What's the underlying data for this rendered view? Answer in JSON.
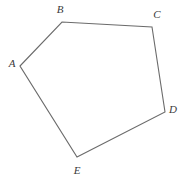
{
  "figure": {
    "kind": "geometry-diagram",
    "shape_name": "pentagon",
    "background_color": "#ffffff",
    "stroke_color": "#6b6b6b",
    "stroke_width": 1.1,
    "label_color": "#3a3a3a",
    "canvas": {
      "width": 184,
      "height": 179
    }
  },
  "chart_data": {
    "type": "scatter",
    "title": "",
    "subtitle": "",
    "xlabel": "",
    "ylabel": "",
    "grid": false,
    "legend": "none",
    "xlim": [
      0,
      184
    ],
    "ylim": [
      0,
      179
    ],
    "shape": "closed polygon (pentagon) ABCDE",
    "vertex_labels": [
      "A",
      "B",
      "C",
      "D",
      "E"
    ],
    "x": [
      20,
      62,
      152,
      165,
      77
    ],
    "y": [
      66,
      22,
      27,
      112,
      157
    ],
    "edges": [
      [
        "A",
        "B"
      ],
      [
        "B",
        "C"
      ],
      [
        "C",
        "D"
      ],
      [
        "D",
        "E"
      ],
      [
        "E",
        "A"
      ]
    ]
  },
  "vertices": [
    {
      "id": "A",
      "label": "A",
      "x": 20,
      "y": 66,
      "label_x": 12,
      "label_y": 63
    },
    {
      "id": "B",
      "label": "B",
      "x": 62,
      "y": 22,
      "label_x": 60,
      "label_y": 9
    },
    {
      "id": "C",
      "label": "C",
      "x": 152,
      "y": 27,
      "label_x": 157,
      "label_y": 14
    },
    {
      "id": "D",
      "label": "D",
      "x": 165,
      "y": 112,
      "label_x": 173,
      "label_y": 109
    },
    {
      "id": "E",
      "label": "E",
      "x": 77,
      "y": 157,
      "label_x": 77,
      "label_y": 170
    }
  ],
  "polygon_path": "M 20 66 L 62 22 L 152 27 L 165 112 L 77 157 Z"
}
